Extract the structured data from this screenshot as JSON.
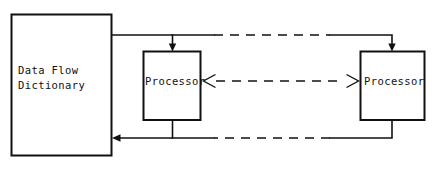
{
  "diagram": {
    "background_color": "#ffffff",
    "line_color": "#111111",
    "nodes": [
      {
        "id": "data-flow-dictionary",
        "label_line1": "Data Flow",
        "label_line2": "Dictionary",
        "shape": "rectangle"
      },
      {
        "id": "processor-left",
        "label": "Processor",
        "shape": "rectangle"
      },
      {
        "id": "processor-right",
        "label": "Processor",
        "shape": "rectangle"
      }
    ],
    "connectors": [
      {
        "id": "top-connector",
        "style": "solid-dashed-solid",
        "from": "data-flow-dictionary",
        "to": "processor-left, processor-right",
        "arrowheads": "down into both processors"
      },
      {
        "id": "middle-connector",
        "style": "dashed",
        "from": "processor-left",
        "to": "processor-right",
        "arrowheads": "bidirectional open"
      },
      {
        "id": "bottom-connector",
        "style": "solid-dashed-solid",
        "from": "processor-left, processor-right",
        "to": "data-flow-dictionary",
        "arrowheads": "left into dictionary"
      }
    ]
  }
}
